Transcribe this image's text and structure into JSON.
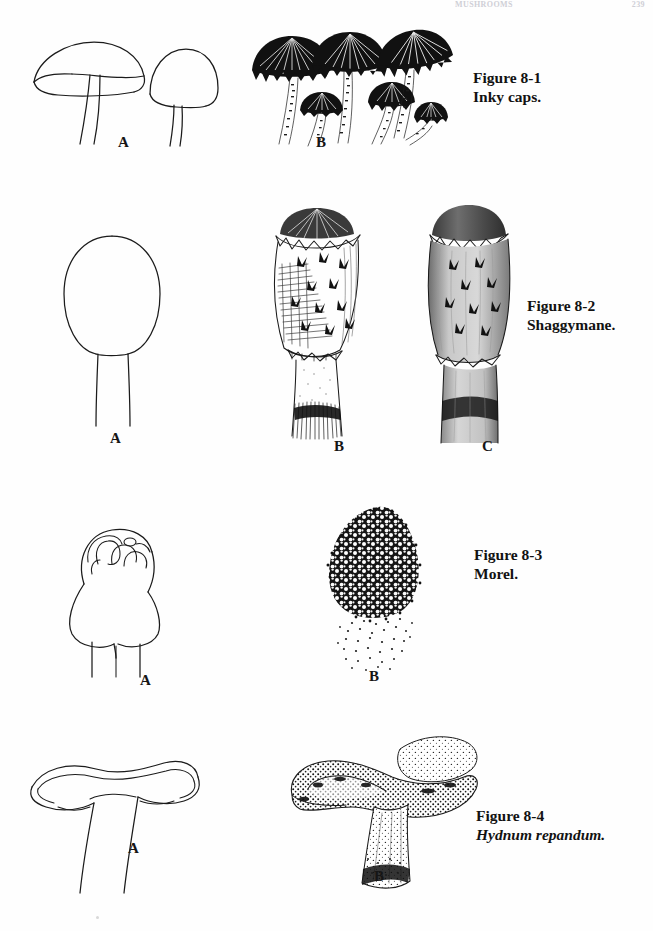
{
  "page": {
    "running_head_left": "MUSHROOMS",
    "running_head_right": "239"
  },
  "figures": [
    {
      "id": "figure-8-1",
      "caption_line1": "Figure 8-1",
      "caption_line2": "Inky caps.",
      "caption_line2_style": "roman",
      "panels": [
        {
          "label": "A",
          "kind": "line-drawing",
          "subject": "two bell-shaped inky cap mushrooms outline"
        },
        {
          "label": "B",
          "kind": "ink-drawing",
          "subject": "cluster of inky cap mushrooms, shaded"
        }
      ]
    },
    {
      "id": "figure-8-2",
      "caption_line1": "Figure 8-2",
      "caption_line2": "Shaggymane.",
      "caption_line2_style": "roman",
      "panels": [
        {
          "label": "A",
          "kind": "line-drawing",
          "subject": "tall cylindrical shaggymane cap outline on stalk"
        },
        {
          "label": "B",
          "kind": "ink-drawing",
          "subject": "shaggymane with scaly cap and ring, hatched"
        },
        {
          "label": "C",
          "kind": "ink-drawing",
          "subject": "shaggymane close-up, tonal wash"
        }
      ]
    },
    {
      "id": "figure-8-3",
      "caption_line1": "Figure 8-3",
      "caption_line2": "Morel.",
      "caption_line2_style": "roman",
      "panels": [
        {
          "label": "A",
          "kind": "line-drawing",
          "subject": "morel outline with pitted ridged cap"
        },
        {
          "label": "B",
          "kind": "ink-drawing",
          "subject": "morel with honeycombed cap, stippled stalk"
        }
      ]
    },
    {
      "id": "figure-8-4",
      "caption_line1": "Figure 8-4",
      "caption_line2": "Hydnum repandum.",
      "caption_line2_style": "italic",
      "panels": [
        {
          "label": "A",
          "kind": "line-drawing",
          "subject": "funnel-shaped hedgehog mushroom outline"
        },
        {
          "label": "B",
          "kind": "ink-drawing",
          "subject": "hedgehog mushroom with stippled toothed cap"
        }
      ]
    }
  ]
}
